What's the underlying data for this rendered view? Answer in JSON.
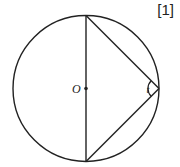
{
  "marks_label": "[1]",
  "figure": {
    "center_label": "O",
    "angle_label": "t",
    "shapes": [
      "circle",
      "diameter",
      "inscribed-triangle"
    ]
  }
}
